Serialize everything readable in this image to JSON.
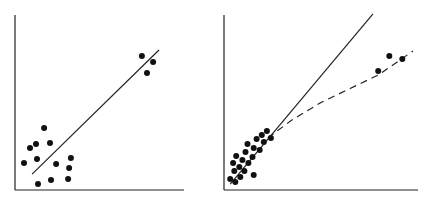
{
  "chart_data": [
    {
      "type": "scatter",
      "title": "",
      "xlabel": "",
      "ylabel": "",
      "xlim": [
        0,
        100
      ],
      "ylim": [
        0,
        100
      ],
      "grid": false,
      "points": [
        {
          "x": 5.3,
          "y": 15.4
        },
        {
          "x": 8.9,
          "y": 24.0
        },
        {
          "x": 12.4,
          "y": 26.3
        },
        {
          "x": 17.2,
          "y": 35.4
        },
        {
          "x": 20.7,
          "y": 26.9
        },
        {
          "x": 13.0,
          "y": 17.7
        },
        {
          "x": 24.3,
          "y": 14.9
        },
        {
          "x": 33.1,
          "y": 18.3
        },
        {
          "x": 32.0,
          "y": 12.6
        },
        {
          "x": 31.4,
          "y": 6.3
        },
        {
          "x": 21.3,
          "y": 5.7
        },
        {
          "x": 13.6,
          "y": 3.4
        },
        {
          "x": 75.1,
          "y": 76.6
        },
        {
          "x": 81.7,
          "y": 73.1
        },
        {
          "x": 78.1,
          "y": 66.9
        }
      ],
      "lines": [
        {
          "style": "solid",
          "points": [
            {
              "x": 10.1,
              "y": 9.1
            },
            {
              "x": 85.2,
              "y": 80.0
            }
          ]
        }
      ]
    },
    {
      "type": "scatter",
      "title": "",
      "xlabel": "",
      "ylabel": "",
      "xlim": [
        0,
        100
      ],
      "ylim": [
        0,
        100
      ],
      "grid": false,
      "points": [
        {
          "x": 3.2,
          "y": 6.3
        },
        {
          "x": 5.3,
          "y": 10.9
        },
        {
          "x": 4.7,
          "y": 15.4
        },
        {
          "x": 7.9,
          "y": 13.1
        },
        {
          "x": 6.3,
          "y": 19.4
        },
        {
          "x": 9.5,
          "y": 17.1
        },
        {
          "x": 11.1,
          "y": 21.7
        },
        {
          "x": 12.6,
          "y": 15.4
        },
        {
          "x": 14.7,
          "y": 18.9
        },
        {
          "x": 12.1,
          "y": 26.3
        },
        {
          "x": 15.3,
          "y": 24.0
        },
        {
          "x": 16.8,
          "y": 29.1
        },
        {
          "x": 18.4,
          "y": 22.9
        },
        {
          "x": 19.5,
          "y": 31.4
        },
        {
          "x": 20.5,
          "y": 27.4
        },
        {
          "x": 22.1,
          "y": 33.7
        },
        {
          "x": 24.2,
          "y": 29.7
        },
        {
          "x": 15.3,
          "y": 8.6
        },
        {
          "x": 10.5,
          "y": 10.9
        },
        {
          "x": 8.4,
          "y": 7.4
        },
        {
          "x": 5.8,
          "y": 4.6
        },
        {
          "x": 79.5,
          "y": 68.0
        },
        {
          "x": 85.2,
          "y": 76.6
        },
        {
          "x": 91.9,
          "y": 74.9
        }
      ],
      "lines": [
        {
          "style": "solid",
          "points": [
            {
              "x": 3.2,
              "y": 3.4
            },
            {
              "x": 76.8,
              "y": 100.6
            }
          ]
        },
        {
          "style": "dashed",
          "points": [
            {
              "x": 22.6,
              "y": 29.7
            },
            {
              "x": 35.0,
              "y": 40.0
            },
            {
              "x": 50.0,
              "y": 50.0
            },
            {
              "x": 65.0,
              "y": 58.0
            },
            {
              "x": 80.0,
              "y": 66.0
            },
            {
              "x": 97.4,
              "y": 79.4
            }
          ]
        }
      ]
    }
  ]
}
